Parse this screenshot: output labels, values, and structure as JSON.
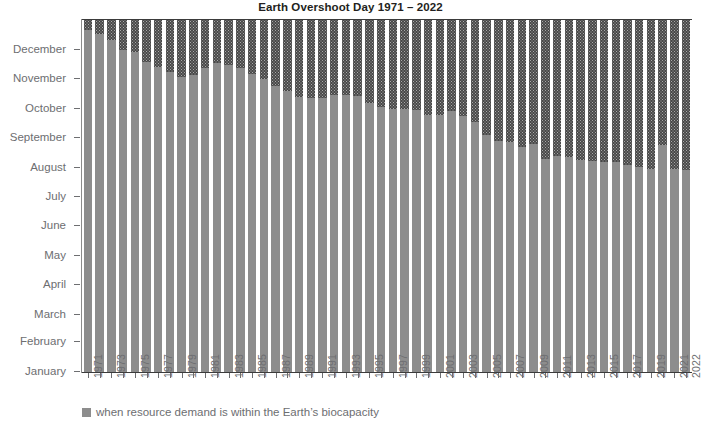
{
  "chart": {
    "title": "Earth Overshoot Day 1971 – 2022",
    "legend": {
      "swatch_name": "within-biocapacity-swatch",
      "label": "when resource demand is within the Earth’s biocapacity"
    },
    "colors": {
      "within_biocapacity": "#8d8d8d",
      "overshoot": "#484848",
      "axis": "#6d6e71",
      "title": "#231f20",
      "background": "#ffffff"
    }
  },
  "chart_data": {
    "type": "bar",
    "title": "Earth Overshoot Day 1971 – 2022",
    "subtitle": "",
    "xlabel": "",
    "ylabel": "",
    "grid": false,
    "legend_position": "bottom-left",
    "stacked": true,
    "ylim": [
      "January 1",
      "December 31"
    ],
    "ytick_labels": [
      "January",
      "February",
      "March",
      "April",
      "May",
      "June",
      "July",
      "August",
      "September",
      "October",
      "November",
      "December"
    ],
    "ytick_day_of_year": [
      1,
      32,
      60,
      91,
      121,
      152,
      182,
      213,
      244,
      274,
      305,
      335
    ],
    "series": [
      {
        "name": "when resource demand is within the Earth’s biocapacity",
        "color": "#8d8d8d"
      },
      {
        "name": "overshoot (demand exceeds biocapacity)",
        "color": "#484848"
      }
    ],
    "categories": [
      1971,
      1972,
      1973,
      1974,
      1975,
      1976,
      1977,
      1978,
      1979,
      1980,
      1981,
      1982,
      1983,
      1984,
      1985,
      1986,
      1987,
      1988,
      1989,
      1990,
      1991,
      1992,
      1993,
      1994,
      1995,
      1996,
      1997,
      1998,
      1999,
      2000,
      2001,
      2002,
      2003,
      2004,
      2005,
      2006,
      2007,
      2008,
      2009,
      2010,
      2011,
      2012,
      2013,
      2014,
      2015,
      2016,
      2017,
      2018,
      2019,
      2020,
      2021,
      2022
    ],
    "xtick_labels": [
      "1971",
      "1973",
      "1975",
      "1977",
      "1979",
      "1981",
      "1983",
      "1985",
      "1987",
      "1989",
      "1991",
      "1993",
      "1995",
      "1997",
      "1999",
      "2001",
      "2003",
      "2005",
      "2007",
      "2009",
      "2011",
      "2013",
      "2015",
      "2017",
      "2019",
      "2021",
      "2022"
    ],
    "overshoot_day": [
      "December 21",
      "December 16",
      "December 10",
      "November 30",
      "November 28",
      "November 16",
      "November 12",
      "November 7",
      "November 2",
      "November 3",
      "November 11",
      "November 16",
      "November 14",
      "November 10",
      "November 5",
      "October 31",
      "October 24",
      "October 17",
      "October 12",
      "October 11",
      "October 11",
      "October 13",
      "October 14",
      "October 13",
      "October 6",
      "October 1",
      "September 30",
      "September 30",
      "September 29",
      "September 23",
      "September 23",
      "September 28",
      "September 22",
      "September 15",
      "September 3",
      "August 28",
      "August 27",
      "August 20",
      "August 24",
      "August 9",
      "August 12",
      "August 10",
      "August 8",
      "August 7",
      "August 6",
      "August 5",
      "August 3",
      "August 1",
      "July 29",
      "August 22",
      "July 29",
      "July 28"
    ],
    "overshoot_day_of_year": [
      355,
      350,
      344,
      334,
      332,
      321,
      316,
      311,
      306,
      308,
      315,
      320,
      318,
      315,
      309,
      304,
      297,
      291,
      285,
      284,
      284,
      287,
      287,
      286,
      279,
      275,
      273,
      273,
      272,
      267,
      266,
      271,
      265,
      259,
      246,
      240,
      239,
      233,
      236,
      221,
      224,
      223,
      220,
      219,
      218,
      218,
      215,
      213,
      210,
      235,
      210,
      209
    ]
  }
}
